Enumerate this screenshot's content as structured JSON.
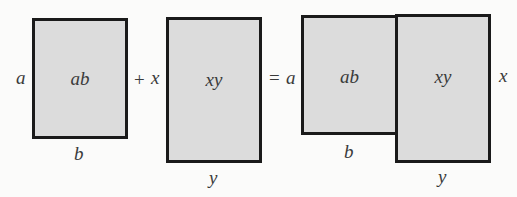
{
  "diagram": {
    "title": "",
    "shapes": {
      "rect_ab": {
        "area_label": "ab",
        "height_label": "a",
        "width_label": "b"
      },
      "rect_xy": {
        "area_label": "xy",
        "height_label": "x",
        "width_label": "y"
      },
      "combined": {
        "left_rect": {
          "area_label": "ab",
          "height_label": "a",
          "width_label": "b"
        },
        "right_rect": {
          "area_label": "xy",
          "height_label": "x",
          "width_label": "y"
        }
      }
    },
    "operators": {
      "plus": "+",
      "equals": "="
    },
    "colors": {
      "fill": "#dcdcdc",
      "stroke": "#1a1a1a",
      "text": "#3a3a3a"
    }
  }
}
